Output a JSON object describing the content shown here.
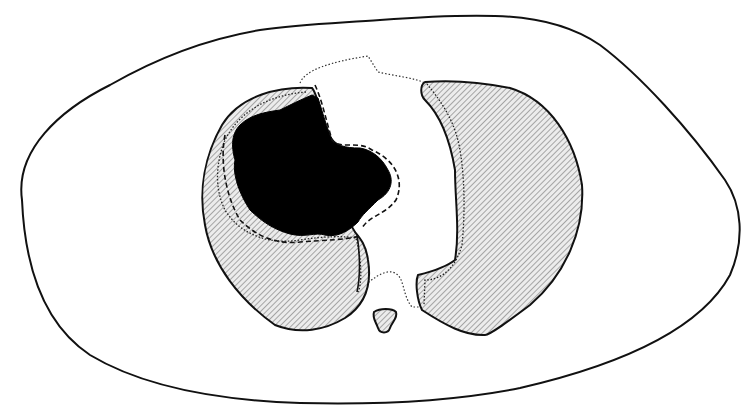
{
  "diagram": {
    "type": "anatomical-cross-section",
    "labels": [],
    "colors": {
      "background": "#ffffff",
      "outline": "#111111",
      "hatch_line": "#555555",
      "hatch_fill": "#e6e6e6",
      "lesion": "#000000"
    },
    "elements": [
      {
        "id": "body-outline",
        "style": "solid"
      },
      {
        "id": "right-lung",
        "style": "hatched",
        "side": "left-of-image"
      },
      {
        "id": "left-lung",
        "style": "hatched",
        "side": "right-of-image"
      },
      {
        "id": "cavity-mass",
        "style": "solid-black"
      },
      {
        "id": "mass-margin",
        "style": "dashed"
      },
      {
        "id": "pleural-margin",
        "style": "dotted"
      },
      {
        "id": "mediastinum-outline",
        "style": "dotted"
      },
      {
        "id": "vertebra",
        "style": "hatched"
      }
    ]
  }
}
